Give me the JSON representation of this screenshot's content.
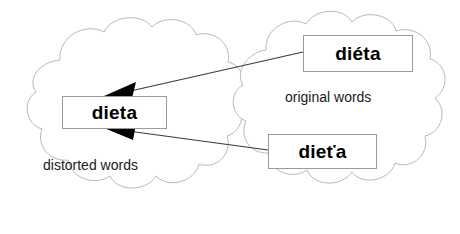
{
  "diagram": {
    "background_color": "#ffffff",
    "clouds": [
      {
        "id": "distorted-cloud",
        "label": "distorted words",
        "outline_color": "#b9b9b9",
        "fill_color": "#ffffff"
      },
      {
        "id": "original-cloud",
        "label": "original words",
        "outline_color": "#b9b9b9",
        "fill_color": "#ffffff"
      }
    ],
    "boxes": [
      {
        "id": "box-dieta-distorted",
        "text": "dieta",
        "group": "distorted words",
        "border_color": "#9a9a9a",
        "fill_color": "#ffffff",
        "text_color": "#000000"
      },
      {
        "id": "box-dieta-original",
        "text": "diéta",
        "group": "original words",
        "border_color": "#9a9a9a",
        "fill_color": "#ffffff",
        "text_color": "#000000"
      },
      {
        "id": "box-dietza-original",
        "text": "dieťa",
        "group": "original words",
        "border_color": "#9a9a9a",
        "fill_color": "#ffffff",
        "text_color": "#000000"
      }
    ],
    "arrows": [
      {
        "id": "arrow-dieta-accent-to-dieta",
        "from": "diéta",
        "to": "dieta",
        "color": "#3a3a3a",
        "arrowhead_color": "#000000"
      },
      {
        "id": "arrow-dietza-to-dieta",
        "from": "dieťa",
        "to": "dieta",
        "color": "#3a3a3a",
        "arrowhead_color": "#000000"
      }
    ]
  }
}
